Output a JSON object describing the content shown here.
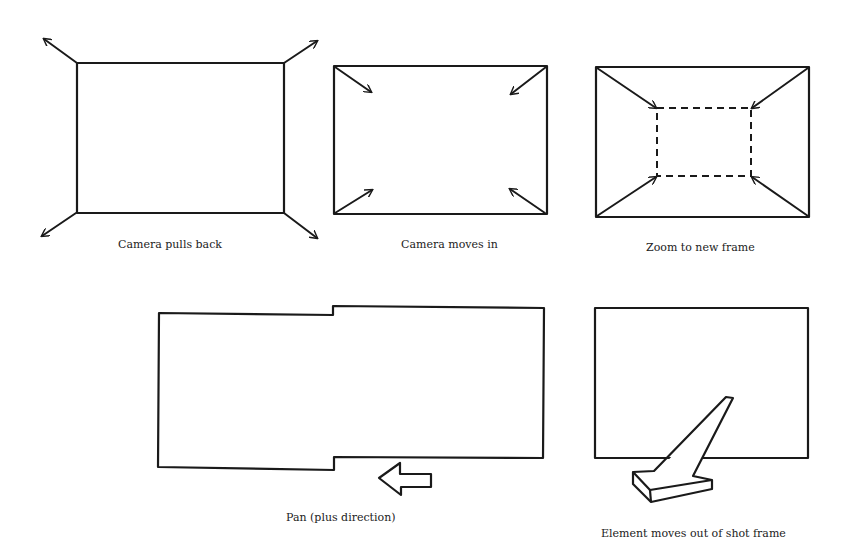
{
  "panels": [
    {
      "id": "pull-back",
      "caption": "Camera pulls back"
    },
    {
      "id": "move-in",
      "caption": "Camera moves in"
    },
    {
      "id": "zoom",
      "caption": "Zoom to new frame"
    },
    {
      "id": "pan",
      "caption": "Pan (plus direction)"
    },
    {
      "id": "element-out",
      "caption": "Element moves out of shot frame"
    }
  ],
  "colors": {
    "stroke": "#1a1a1a",
    "background": "#ffffff"
  }
}
